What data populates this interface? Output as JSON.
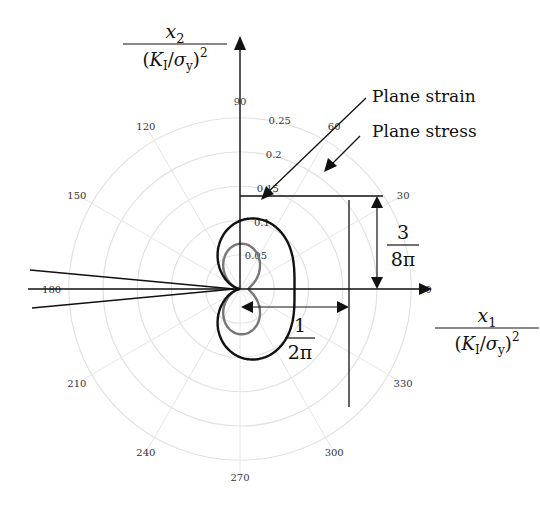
{
  "chart_data": {
    "type": "line",
    "subtype": "polar",
    "title": "",
    "origin_px": [
      240,
      289
    ],
    "px_per_unit": 685,
    "radial_ticks": [
      "0.05",
      "0.1",
      "0.15",
      "0.2",
      "0.25"
    ],
    "radial_values": [
      0.05,
      0.1,
      0.15,
      0.2,
      0.25
    ],
    "angular_ticks": [
      "0",
      "30",
      "60",
      "90",
      "120",
      "150",
      "180",
      "210",
      "240",
      "270",
      "300",
      "330"
    ],
    "grid": true,
    "xlabel_num": "x",
    "xlabel_sub": "1",
    "ylabel_num": "x",
    "ylabel_sub": "2",
    "axis_den": "(K",
    "axis_den_sub": "I",
    "axis_den_rest": "/σ",
    "axis_den_sub2": "y",
    "axis_den_end": ")",
    "axis_den_sup": "2",
    "series": [
      {
        "name": "Plane strain",
        "color": "#777777",
        "formula": "r = (1/(4π)) cos²(θ/2) [ (1-2ν)² + 3 sin²(θ/2) ], ν≈0.3"
      },
      {
        "name": "Plane stress",
        "color": "#111111",
        "formula": "r = (1/(4π)) cos²(θ/2) [ 1 + 3 sin²(θ/2) ]"
      }
    ],
    "annotations": [
      {
        "text": "Plane strain",
        "type": "legend-arrow"
      },
      {
        "text": "Plane stress",
        "type": "legend-arrow"
      },
      {
        "num": "3",
        "den": "8π",
        "meaning": "height of plane stress zone = 3/(8π)"
      },
      {
        "num": "1",
        "den": "2π",
        "meaning": "width of plane stress zone = 1/(2π)"
      }
    ]
  }
}
